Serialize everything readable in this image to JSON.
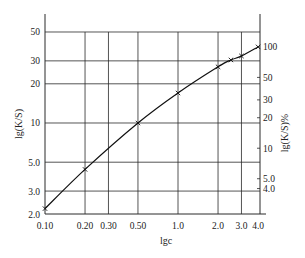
{
  "chart_data": {
    "type": "line",
    "title": "",
    "xlabel": "lgc",
    "ylabel": "lg(K/S)",
    "y2label": "lg(K/S)%",
    "x_scale": "log",
    "y_scale": "log",
    "xlim": [
      0.1,
      4.0
    ],
    "ylim": [
      2.0,
      50
    ],
    "x_ticks": [
      {
        "value": 0.1,
        "label": "0.10"
      },
      {
        "value": 0.2,
        "label": "0.20"
      },
      {
        "value": 0.3,
        "label": "0.30"
      },
      {
        "value": 0.5,
        "label": "0.50"
      },
      {
        "value": 1.0,
        "label": "1.0"
      },
      {
        "value": 2.0,
        "label": "2.0"
      },
      {
        "value": 3.0,
        "label": "3.0"
      },
      {
        "value": 4.0,
        "label": "4.0"
      }
    ],
    "y_ticks": [
      {
        "value": 2.0,
        "label": "2.0"
      },
      {
        "value": 3.0,
        "label": "3.0"
      },
      {
        "value": 5.0,
        "label": "5.0"
      },
      {
        "value": 10,
        "label": "10"
      },
      {
        "value": 20,
        "label": "20"
      },
      {
        "value": 30,
        "label": "30"
      },
      {
        "value": 50,
        "label": "50"
      }
    ],
    "y2_ticks": [
      {
        "value": 4.0,
        "label": "4.0"
      },
      {
        "value": 5.0,
        "label": "5.0"
      },
      {
        "value": 10,
        "label": "10"
      },
      {
        "value": 20,
        "label": "20"
      },
      {
        "value": 30,
        "label": "30"
      },
      {
        "value": 50,
        "label": "50"
      },
      {
        "value": 100,
        "label": "100"
      }
    ],
    "y2_mapping": {
      "value_at_top_ref": 100,
      "y_at_top_ref": 38.4,
      "value_at_low_ref": 10,
      "y_at_low_ref": 6.4
    },
    "grid": true,
    "legend": null,
    "series": [
      {
        "name": "lg(K/S) vs lgc",
        "marker": "x",
        "x": [
          0.1,
          0.2,
          0.5,
          1.0,
          2.0,
          2.5,
          3.0,
          4.0
        ],
        "y": [
          2.2,
          4.4,
          10,
          17,
          27,
          30.5,
          32.7,
          38.4
        ],
        "markers_at": [
          0.1,
          0.2,
          0.5,
          1.0,
          2.0,
          2.5,
          3.0,
          4.0
        ]
      }
    ]
  }
}
